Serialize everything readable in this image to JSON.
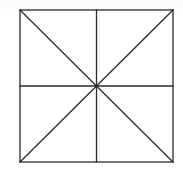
{
  "diagram": {
    "title": "",
    "stroke_color": "#2b2b2b",
    "background_color": "#ffffff",
    "square": {
      "x1": 20,
      "y1": 10,
      "x2": 173,
      "y2": 162
    },
    "center": {
      "x": 96.5,
      "y": 86
    },
    "lines": [
      {
        "name": "vertical-midline",
        "x1": 96.5,
        "y1": 10,
        "x2": 96.5,
        "y2": 162
      },
      {
        "name": "horizontal-midline",
        "x1": 20,
        "y1": 86,
        "x2": 173,
        "y2": 86
      },
      {
        "name": "diagonal-tl-br",
        "x1": 20,
        "y1": 10,
        "x2": 173,
        "y2": 162
      },
      {
        "name": "diagonal-tr-bl",
        "x1": 173,
        "y1": 10,
        "x2": 20,
        "y2": 162
      }
    ],
    "regions": 8
  }
}
